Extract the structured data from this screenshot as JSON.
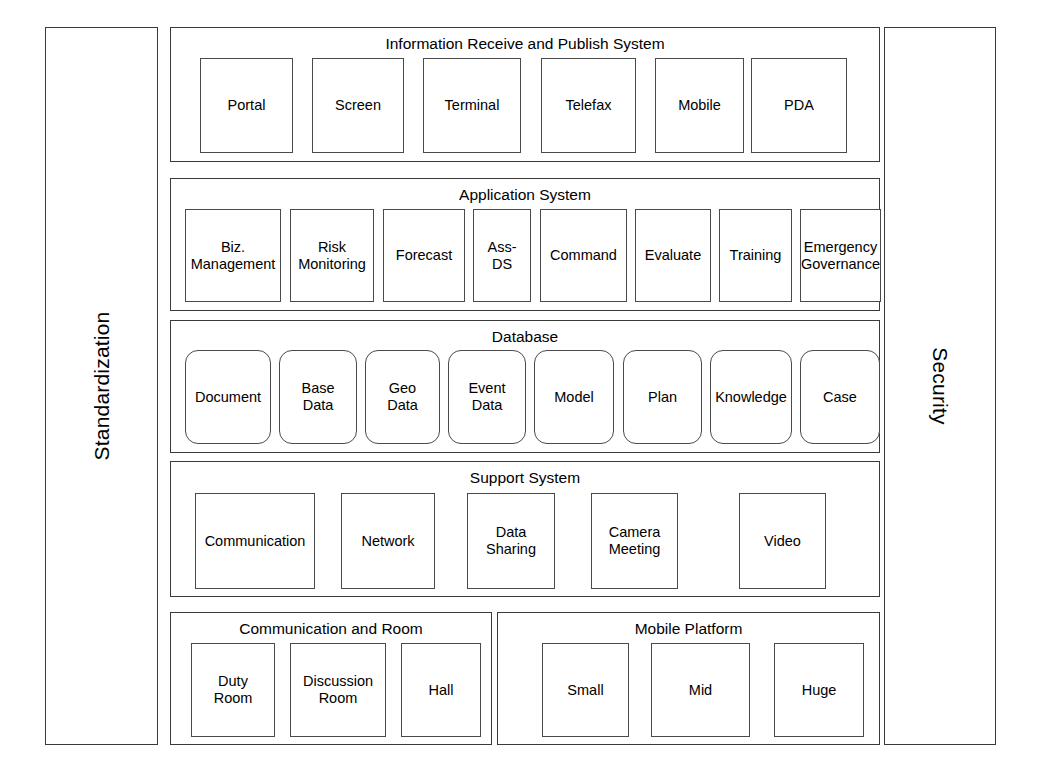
{
  "diagram": {
    "type": "layered-architecture"
  },
  "pillars": {
    "left": {
      "label": "Standardization",
      "orientation": "vertical-up"
    },
    "right": {
      "label": "Security",
      "orientation": "vertical-down"
    }
  },
  "layers": [
    {
      "id": "information-receive-and-publish-system",
      "title": "Information Receive and Publish System",
      "shape": "rect",
      "nodes": [
        {
          "label": "Portal"
        },
        {
          "label": "Screen"
        },
        {
          "label": "Terminal"
        },
        {
          "label": "Telefax"
        },
        {
          "label": "Mobile"
        },
        {
          "label": "PDA"
        }
      ]
    },
    {
      "id": "application-system",
      "title": "Application System",
      "shape": "rect",
      "nodes": [
        {
          "label": "Biz.\nManagement"
        },
        {
          "label": "Risk\nMonitoring"
        },
        {
          "label": "Forecast"
        },
        {
          "label": "Ass-\nDS"
        },
        {
          "label": "Command"
        },
        {
          "label": "Evaluate"
        },
        {
          "label": "Training"
        },
        {
          "label": "Emergency\nGovernance"
        }
      ]
    },
    {
      "id": "database",
      "title": "Database",
      "shape": "rounded-rect",
      "nodes": [
        {
          "label": "Document"
        },
        {
          "label": "Base\nData"
        },
        {
          "label": "Geo\nData"
        },
        {
          "label": "Event\nData"
        },
        {
          "label": "Model"
        },
        {
          "label": "Plan"
        },
        {
          "label": "Knowledge"
        },
        {
          "label": "Case"
        }
      ]
    },
    {
      "id": "support-system",
      "title": "Support System",
      "shape": "rect",
      "nodes": [
        {
          "label": "Communication"
        },
        {
          "label": "Network"
        },
        {
          "label": "Data\nSharing"
        },
        {
          "label": "Camera\nMeeting"
        },
        {
          "label": "Video"
        }
      ]
    }
  ],
  "bottom_panels": [
    {
      "id": "communication-and-room",
      "title": "Communication and Room",
      "shape": "rect",
      "nodes": [
        {
          "label": "Duty\nRoom"
        },
        {
          "label": "Discussion\nRoom"
        },
        {
          "label": "Hall"
        }
      ]
    },
    {
      "id": "mobile-platform",
      "title": "Mobile Platform",
      "shape": "rect",
      "nodes": [
        {
          "label": "Small"
        },
        {
          "label": "Mid"
        },
        {
          "label": "Huge"
        }
      ]
    }
  ],
  "geometry": {
    "layer_nodes": {
      "information-receive-and-publish-system": [
        {
          "x": 29,
          "y": 30,
          "w": 93,
          "h": 95
        },
        {
          "x": 141,
          "y": 30,
          "w": 92,
          "h": 95
        },
        {
          "x": 252,
          "y": 30,
          "w": 98,
          "h": 95
        },
        {
          "x": 370,
          "y": 30,
          "w": 95,
          "h": 95
        },
        {
          "x": 484,
          "y": 30,
          "w": 89,
          "h": 95
        },
        {
          "x": 580,
          "y": 30,
          "w": 96,
          "h": 95
        }
      ],
      "application-system": [
        {
          "x": 14,
          "y": 30,
          "w": 96,
          "h": 93
        },
        {
          "x": 119,
          "y": 30,
          "w": 84,
          "h": 93
        },
        {
          "x": 212,
          "y": 30,
          "w": 82,
          "h": 93
        },
        {
          "x": 302,
          "y": 30,
          "w": 58,
          "h": 93
        },
        {
          "x": 369,
          "y": 30,
          "w": 87,
          "h": 93
        },
        {
          "x": 464,
          "y": 30,
          "w": 76,
          "h": 93
        },
        {
          "x": 548,
          "y": 30,
          "w": 73,
          "h": 93
        },
        {
          "x": 629,
          "y": 30,
          "w": 81,
          "h": 93
        }
      ],
      "database": [
        {
          "x": 14,
          "y": 29,
          "w": 86,
          "h": 94
        },
        {
          "x": 108,
          "y": 29,
          "w": 78,
          "h": 94
        },
        {
          "x": 194,
          "y": 29,
          "w": 75,
          "h": 94
        },
        {
          "x": 277,
          "y": 29,
          "w": 78,
          "h": 94
        },
        {
          "x": 363,
          "y": 29,
          "w": 80,
          "h": 94
        },
        {
          "x": 452,
          "y": 29,
          "w": 79,
          "h": 94
        },
        {
          "x": 539,
          "y": 29,
          "w": 82,
          "h": 94
        },
        {
          "x": 629,
          "y": 29,
          "w": 80,
          "h": 94
        }
      ],
      "support-system": [
        {
          "x": 24,
          "y": 31,
          "w": 120,
          "h": 96
        },
        {
          "x": 170,
          "y": 31,
          "w": 94,
          "h": 96
        },
        {
          "x": 296,
          "y": 31,
          "w": 88,
          "h": 96
        },
        {
          "x": 420,
          "y": 31,
          "w": 87,
          "h": 96
        },
        {
          "x": 568,
          "y": 31,
          "w": 87,
          "h": 96
        }
      ]
    },
    "panel_nodes": {
      "communication-and-room": [
        {
          "x": 20,
          "y": 30,
          "w": 84,
          "h": 94
        },
        {
          "x": 119,
          "y": 30,
          "w": 96,
          "h": 94
        },
        {
          "x": 230,
          "y": 30,
          "w": 80,
          "h": 94
        }
      ],
      "mobile-platform": [
        {
          "x": 44,
          "y": 30,
          "w": 87,
          "h": 94
        },
        {
          "x": 153,
          "y": 30,
          "w": 99,
          "h": 94
        },
        {
          "x": 276,
          "y": 30,
          "w": 90,
          "h": 94
        }
      ]
    }
  }
}
